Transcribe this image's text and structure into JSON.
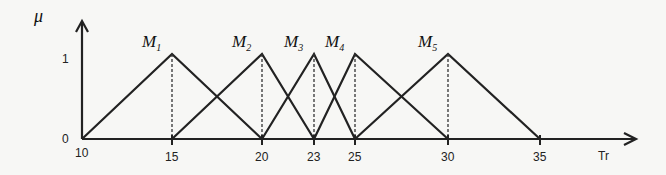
{
  "chart_data": {
    "type": "line",
    "title": "",
    "ylabel": "μ",
    "xlabel": "Tr",
    "y_ticks": [
      "0",
      "1"
    ],
    "x_ticks": [
      "10",
      "15",
      "20",
      "23",
      "25",
      "30",
      "35"
    ],
    "series": [
      {
        "name": "M1",
        "sub": "1",
        "points": [
          [
            10,
            0
          ],
          [
            15,
            1
          ],
          [
            20,
            0
          ]
        ]
      },
      {
        "name": "M2",
        "sub": "2",
        "points": [
          [
            15,
            0
          ],
          [
            20,
            1
          ],
          [
            23,
            0
          ]
        ]
      },
      {
        "name": "M3",
        "sub": "3",
        "points": [
          [
            20,
            0
          ],
          [
            23,
            1
          ],
          [
            25,
            0
          ]
        ]
      },
      {
        "name": "M4",
        "sub": "4",
        "points": [
          [
            23,
            0
          ],
          [
            25,
            1
          ],
          [
            30,
            0
          ]
        ]
      },
      {
        "name": "M5",
        "sub": "5",
        "points": [
          [
            25,
            0
          ],
          [
            30,
            1
          ],
          [
            35,
            0
          ]
        ]
      }
    ],
    "peak_dashed_lines": true
  }
}
